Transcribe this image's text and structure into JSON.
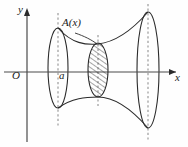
{
  "figure": {
    "caption": "",
    "background_color": "#fefefe",
    "stroke_color": "#2b2b2b",
    "dash_color": "#9a9a9a",
    "hatch_color": "#3a3a3a",
    "axes": {
      "x_label": "x",
      "y_label": "y",
      "origin_label": "O",
      "x_axis_y": 72,
      "y_axis_x": 27
    },
    "labels": {
      "cross_section": "A(x)",
      "left_bound": "a"
    },
    "shapes": {
      "left_ellipse": {
        "cx": 58,
        "cy": 68,
        "rx": 10,
        "ry": 40
      },
      "mid_ellipse": {
        "cx": 98,
        "cy": 70,
        "rx": 10,
        "ry": 27,
        "hatched": true
      },
      "right_ellipse": {
        "cx": 148,
        "cy": 70,
        "rx": 11,
        "ry": 58
      },
      "dashed_lines": [
        {
          "x": 58,
          "y1": 13,
          "y2": 126
        },
        {
          "x": 98,
          "y1": 35,
          "y2": 106
        },
        {
          "x": 148,
          "y1": 4,
          "y2": 142
        }
      ]
    }
  }
}
